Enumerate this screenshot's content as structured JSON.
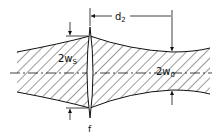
{
  "diagram": {
    "type": "gaussian-beam-focusing",
    "labels": {
      "spot_width_main": "2w",
      "spot_width_sub": "S",
      "waist_width_main": "2w",
      "waist_width_sub": "0",
      "distance_main": "d",
      "distance_sub": "2",
      "lens": "f"
    },
    "colors": {
      "line": "#111111",
      "background": "#ffffff"
    }
  }
}
